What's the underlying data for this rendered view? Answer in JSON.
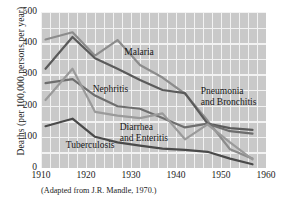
{
  "figure": {
    "caption": "(Adapted from J.R. Mandle, 1970.)"
  },
  "chart_data": {
    "type": "line",
    "title": "",
    "xlabel": "",
    "ylabel": "Deaths (per 100,000 persons per year)",
    "xlim": [
      1910,
      1960
    ],
    "ylim": [
      0,
      500
    ],
    "xticks": [
      "1910",
      "1920",
      "1930",
      "1940",
      "1950",
      "1960"
    ],
    "xtick_values": [
      1910,
      1920,
      1930,
      1940,
      1950,
      1960
    ],
    "yticks": [
      "0",
      "100",
      "200",
      "300",
      "400",
      "500"
    ],
    "ytick_values": [
      0,
      100,
      200,
      300,
      400,
      500
    ],
    "grid": true,
    "grid_color": "#f2f2f2",
    "plot_background": "#c9c9c9",
    "legend": "inline-labels",
    "series": [
      {
        "name": "Malaria",
        "color": "#8c8c8c",
        "label_x": 1928.5,
        "label_y": 368,
        "x": [
          1911,
          1917,
          1922,
          1927,
          1932,
          1937,
          1942,
          1947,
          1952,
          1957
        ],
        "y": [
          412,
          435,
          360,
          410,
          330,
          290,
          238,
          152,
          60,
          30
        ]
      },
      {
        "name": "Pneumonia and Bronchitis",
        "color": "#5a5a5a",
        "label_x": 1945.5,
        "label_y": 243,
        "x": [
          1911,
          1917,
          1922,
          1927,
          1932,
          1937,
          1942,
          1947,
          1952,
          1957
        ],
        "y": [
          318,
          420,
          352,
          318,
          282,
          250,
          240,
          142,
          128,
          122
        ]
      },
      {
        "name": "Nephritis",
        "color": "#6e6e6e",
        "label_x": 1921.5,
        "label_y": 250,
        "x": [
          1911,
          1917,
          1922,
          1927,
          1932,
          1937,
          1942,
          1947,
          1952,
          1957
        ],
        "y": [
          272,
          285,
          232,
          198,
          190,
          160,
          130,
          142,
          118,
          110
        ]
      },
      {
        "name": "Diarrhea and Enteritis",
        "color": "#9a9a9a",
        "label_x": 1927.5,
        "label_y": 128,
        "x": [
          1911,
          1917,
          1922,
          1927,
          1932,
          1937,
          1942,
          1947,
          1952,
          1957
        ],
        "y": [
          218,
          318,
          180,
          168,
          160,
          175,
          92,
          140,
          82,
          28
        ]
      },
      {
        "name": "Tuberculosis",
        "color": "#4a4a4a",
        "label_x": 1915.5,
        "label_y": 72,
        "x": [
          1911,
          1917,
          1922,
          1927,
          1932,
          1937,
          1942,
          1947,
          1952,
          1957
        ],
        "y": [
          134,
          158,
          100,
          82,
          72,
          62,
          58,
          52,
          30,
          12
        ]
      }
    ]
  }
}
